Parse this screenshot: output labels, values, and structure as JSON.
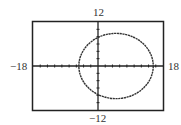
{
  "chart_data": {
    "type": "line",
    "title": "",
    "xlabel": "",
    "ylabel": "",
    "xlim": [
      -18,
      18
    ],
    "ylim": [
      -12,
      12
    ],
    "tick_labels": {
      "xmin": "−18",
      "xmax": "18",
      "ymin": "−12",
      "ymax": "12"
    },
    "x_tick_spacing": 2,
    "y_tick_spacing": 2,
    "grid": false,
    "legend": null,
    "series": [
      {
        "name": "closed curve (circle/ellipse)",
        "shape": "ellipse",
        "center": [
          5,
          0
        ],
        "radius_x": 10.3,
        "radius_y": 8.9,
        "x_intercepts": [
          -5.5,
          15.2
        ],
        "y_intercepts": [
          8,
          -8
        ],
        "style": "dotted"
      }
    ]
  },
  "labels": {
    "ymax": "12",
    "ymin": "−12",
    "xmin": "−18",
    "xmax": "18"
  },
  "colors": {
    "axis": "#222222",
    "curve": "#333333",
    "frame": "#222222"
  }
}
